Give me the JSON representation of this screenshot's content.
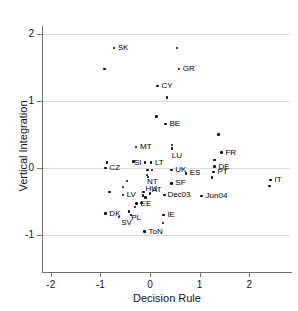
{
  "chart_data": {
    "type": "scatter",
    "title": "",
    "xlabel": "Decision Rule",
    "ylabel": "Vertical Integration",
    "xlim": [
      -2.2,
      2.9
    ],
    "ylim": [
      -1.1,
      2.2
    ],
    "xticks": [
      -2,
      -1,
      0,
      1,
      2
    ],
    "xtick_labels": [
      "-2",
      "-1",
      "0",
      "1",
      "2"
    ],
    "yticks": [
      2,
      1,
      0,
      -1
    ],
    "ytick_labels": [
      "2",
      "1",
      "0",
      "-1"
    ],
    "grid": "horizontal",
    "legend": "none",
    "points": [
      {
        "label": "SK",
        "x": -0.73,
        "y": 1.79,
        "lx": 4,
        "ly": -4
      },
      {
        "label": "",
        "x": -0.92,
        "y": 1.48,
        "lx": 0,
        "ly": 0
      },
      {
        "label": "",
        "x": 0.55,
        "y": 1.79,
        "lx": 0,
        "ly": 0
      },
      {
        "label": "GR",
        "x": 0.58,
        "y": 1.48,
        "lx": 4,
        "ly": -4
      },
      {
        "label": "CY",
        "x": 0.15,
        "y": 1.22,
        "lx": 4,
        "ly": -4
      },
      {
        "label": "",
        "x": 0.34,
        "y": 1.05,
        "lx": 0,
        "ly": 0
      },
      {
        "label": "",
        "x": 0.13,
        "y": 0.77,
        "lx": 0,
        "ly": 0
      },
      {
        "label": "BE",
        "x": 0.31,
        "y": 0.66,
        "lx": 4,
        "ly": -4
      },
      {
        "label": "",
        "x": 1.38,
        "y": 0.5,
        "lx": 0,
        "ly": 0
      },
      {
        "label": "MT",
        "x": -0.28,
        "y": 0.31,
        "lx": 4,
        "ly": -4
      },
      {
        "label": "",
        "x": 0.44,
        "y": 0.34,
        "lx": 0,
        "ly": 0
      },
      {
        "label": "LU",
        "x": 0.44,
        "y": 0.29,
        "lx": 0,
        "ly": 3
      },
      {
        "label": "FR",
        "x": 1.44,
        "y": 0.23,
        "lx": 4,
        "ly": -4
      },
      {
        "label": "",
        "x": -0.87,
        "y": 0.08,
        "lx": 0,
        "ly": 0
      },
      {
        "label": "",
        "x": -0.33,
        "y": 0.1,
        "lx": 0,
        "ly": 0
      },
      {
        "label": "SI",
        "x": -0.1,
        "y": 0.08,
        "lx": -11,
        "ly": -4
      },
      {
        "label": "LT",
        "x": 0.02,
        "y": 0.08,
        "lx": 4,
        "ly": -4
      },
      {
        "label": "",
        "x": 1.3,
        "y": 0.12,
        "lx": 0,
        "ly": 0
      },
      {
        "label": "CZ",
        "x": -0.9,
        "y": 0.0,
        "lx": 4,
        "ly": -4
      },
      {
        "label": "DE",
        "x": 1.3,
        "y": 0.02,
        "lx": 4,
        "ly": -4
      },
      {
        "label": "UK",
        "x": 0.43,
        "y": -0.03,
        "lx": 4,
        "ly": -4
      },
      {
        "label": "",
        "x": -0.05,
        "y": -0.03,
        "lx": 0,
        "ly": 0
      },
      {
        "label": "",
        "x": 0.04,
        "y": -0.03,
        "lx": 0,
        "ly": 0
      },
      {
        "label": "ES",
        "x": 0.72,
        "y": -0.08,
        "lx": 4,
        "ly": -4
      },
      {
        "label": "PT",
        "x": 1.28,
        "y": -0.06,
        "lx": 4,
        "ly": -4
      },
      {
        "label": "NT",
        "x": -0.06,
        "y": -0.1,
        "lx": 0,
        "ly": 3
      },
      {
        "label": "",
        "x": -0.04,
        "y": -0.13,
        "lx": 0,
        "ly": 0
      },
      {
        "label": "",
        "x": 1.25,
        "y": -0.14,
        "lx": 0,
        "ly": 0
      },
      {
        "label": "IT",
        "x": 2.43,
        "y": -0.18,
        "lx": 4,
        "ly": -4
      },
      {
        "label": "",
        "x": -0.47,
        "y": -0.19,
        "lx": 0,
        "ly": 0
      },
      {
        "label": "SF",
        "x": 0.43,
        "y": -0.23,
        "lx": 4,
        "ly": -4
      },
      {
        "label": "",
        "x": 2.41,
        "y": -0.27,
        "lx": 0,
        "ly": 0
      },
      {
        "label": "",
        "x": -0.55,
        "y": -0.28,
        "lx": 0,
        "ly": 0
      },
      {
        "label": "HU",
        "x": -0.13,
        "y": -0.36,
        "lx": 2,
        "ly": -7
      },
      {
        "label": "AT",
        "x": 0.0,
        "y": -0.38,
        "lx": 2,
        "ly": -7
      },
      {
        "label": "",
        "x": -0.82,
        "y": -0.36,
        "lx": 0,
        "ly": 0
      },
      {
        "label": "LV",
        "x": -0.55,
        "y": -0.4,
        "lx": 4,
        "ly": -4
      },
      {
        "label": "Dec03",
        "x": 0.29,
        "y": -0.4,
        "lx": 3,
        "ly": -4
      },
      {
        "label": "Jun04",
        "x": 1.04,
        "y": -0.42,
        "lx": 4,
        "ly": -4
      },
      {
        "label": "",
        "x": -0.14,
        "y": -0.41,
        "lx": 0,
        "ly": 0
      },
      {
        "label": "",
        "x": -0.09,
        "y": -0.44,
        "lx": 0,
        "ly": 0
      },
      {
        "label": "EE",
        "x": -0.27,
        "y": -0.53,
        "lx": 4,
        "ly": -4
      },
      {
        "label": "",
        "x": -0.17,
        "y": -0.52,
        "lx": 0,
        "ly": 0
      },
      {
        "label": "",
        "x": -0.3,
        "y": -0.58,
        "lx": 0,
        "ly": 0
      },
      {
        "label": "DK",
        "x": -0.9,
        "y": -0.68,
        "lx": 4,
        "ly": -4
      },
      {
        "label": "PL",
        "x": -0.42,
        "y": -0.65,
        "lx": 2,
        "ly": 2
      },
      {
        "label": "",
        "x": -0.38,
        "y": -0.7,
        "lx": 0,
        "ly": 0
      },
      {
        "label": "IE",
        "x": 0.27,
        "y": -0.7,
        "lx": 4,
        "ly": -4
      },
      {
        "label": "SV",
        "x": -0.62,
        "y": -0.73,
        "lx": 2,
        "ly": 2
      },
      {
        "label": "",
        "x": 0.26,
        "y": -0.82,
        "lx": 0,
        "ly": 0
      },
      {
        "label": "ToN",
        "x": -0.11,
        "y": -0.95,
        "lx": 4,
        "ly": -4
      }
    ]
  }
}
